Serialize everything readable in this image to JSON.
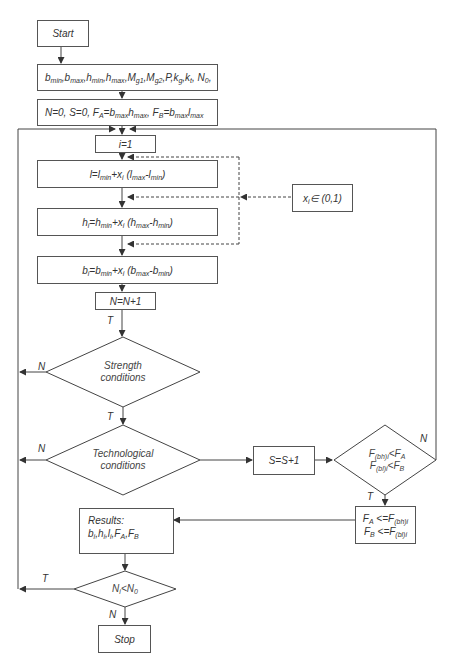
{
  "diagram": {
    "type": "flowchart",
    "nodes": {
      "start": "Start",
      "params": {
        "parts": [
          [
            "b",
            "min"
          ],
          [
            ",b",
            "max"
          ],
          [
            ",h",
            "min"
          ],
          [
            ",h",
            "max"
          ],
          [
            ",M",
            "g1"
          ],
          [
            ",M",
            "g2"
          ],
          [
            ",P,k",
            "g"
          ],
          [
            ",k",
            "t"
          ],
          [
            ", N",
            "0"
          ],
          [
            ",",
            ""
          ]
        ],
        "text": "bmin,bmax,hmin,hmax,Mg1,Mg2,P,kg,kt, N0,"
      },
      "init": {
        "text": "N=0, S=0, FA=bmaxhmax, FB=bmaxlmax",
        "parts": [
          [
            "N=0, S=0, F",
            "A"
          ],
          [
            "=b",
            "max"
          ],
          [
            "h",
            "max"
          ],
          [
            ", F",
            "B"
          ],
          [
            "=b",
            "max"
          ],
          [
            "l",
            "max"
          ]
        ]
      },
      "i_init": "i=1",
      "l_formula": {
        "text": "l=lmin+xi (lmax-lmin)",
        "parts": [
          [
            "l=l",
            "min"
          ],
          [
            "+x",
            "i"
          ],
          [
            " (l",
            "max"
          ],
          [
            "-l",
            "min"
          ],
          [
            ")",
            ""
          ]
        ]
      },
      "xi_range": {
        "text": "xi∈ (0,1)",
        "parts": [
          [
            "x",
            "i"
          ],
          [
            "∈ (0,1)",
            ""
          ]
        ]
      },
      "h_formula": {
        "text": "hi=hmin+xi (hmax-hmin)",
        "parts": [
          [
            "h",
            "i"
          ],
          [
            "=h",
            "min"
          ],
          [
            "+x",
            "i"
          ],
          [
            " (h",
            "max"
          ],
          [
            "-h",
            "min"
          ],
          [
            ")",
            ""
          ]
        ]
      },
      "b_formula": {
        "text": "bi=bmin+xi (bmax-bmin)",
        "parts": [
          [
            "b",
            "i"
          ],
          [
            "=b",
            "min"
          ],
          [
            "+x",
            "i"
          ],
          [
            " (b",
            "max"
          ],
          [
            "-b",
            "min"
          ],
          [
            ")",
            ""
          ]
        ]
      },
      "n_increment": "N=N+1",
      "strength": {
        "line1": "Strength",
        "line2": "conditions"
      },
      "technological": {
        "line1": "Technological",
        "line2": "conditions"
      },
      "s_increment": "S=S+1",
      "f_compare": {
        "line1": {
          "text": "F(bh)i<FA",
          "parts": [
            [
              "F",
              "(bh)i"
            ],
            [
              "<F",
              "A"
            ]
          ]
        },
        "line2": {
          "text": "F(bl)i<FB",
          "parts": [
            [
              "F",
              "(bl)i"
            ],
            [
              "<F",
              "B"
            ]
          ]
        }
      },
      "f_update": {
        "line1": {
          "text": "FA <=F(bh)i",
          "parts": [
            [
              "F",
              "A"
            ],
            [
              " <=F",
              "(bh)i"
            ]
          ]
        },
        "line2": {
          "text": "FB <=F(bl)i",
          "parts": [
            [
              "F",
              "B"
            ],
            [
              " <=F",
              "(bl)i"
            ]
          ]
        }
      },
      "results": {
        "title": "Results:",
        "values": {
          "text": "bi,hi,li,FA,FB",
          "parts": [
            [
              "b",
              "i"
            ],
            [
              ",h",
              "i"
            ],
            [
              ",l",
              "i"
            ],
            [
              ",F",
              "A"
            ],
            [
              ",F",
              "B"
            ]
          ]
        }
      },
      "ni_compare": {
        "text": "Ni<N0",
        "parts": [
          [
            "N",
            "i"
          ],
          [
            "<N",
            "0"
          ]
        ]
      },
      "stop": "Stop"
    },
    "edge_labels": {
      "after_n_increment": "T",
      "strength_no": "N",
      "strength_yes": "T",
      "tech_no": "N",
      "f_compare_no": "N",
      "f_compare_yes": "T",
      "ni_yes": "T",
      "ni_no": "N"
    },
    "colors": {
      "line": "#444444",
      "box_border": "#555555",
      "text": "#333333",
      "background": "#ffffff"
    }
  }
}
